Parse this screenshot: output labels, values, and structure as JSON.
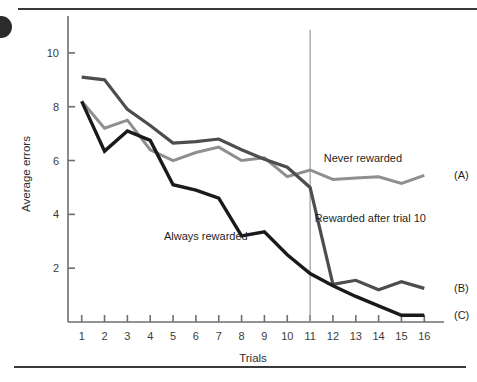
{
  "figure": {
    "background_color": "#ffffff",
    "top_rule_color": "#3a3a3a",
    "bottom_rule_color": "#3a3a3a"
  },
  "chart_data": {
    "type": "line",
    "title": "",
    "subtitle": "",
    "xlabel": "Trials",
    "ylabel": "Average errors",
    "grid": false,
    "legend_position": "inline-annotations",
    "xlim": [
      0.4,
      16.6
    ],
    "ylim": [
      0,
      11
    ],
    "x": [
      1,
      2,
      3,
      4,
      5,
      6,
      7,
      8,
      9,
      10,
      11,
      12,
      13,
      14,
      15,
      16
    ],
    "xticks": [
      "1",
      "2",
      "3",
      "4",
      "5",
      "6",
      "7",
      "8",
      "9",
      "10",
      "11",
      "12",
      "13",
      "14",
      "15",
      "16"
    ],
    "yticks": [
      "2",
      "4",
      "6",
      "8",
      "10"
    ],
    "ytick_values": [
      2,
      4,
      6,
      8,
      10
    ],
    "series": [
      {
        "name": "Never rewarded",
        "tag": "(A)",
        "color": "#8f8f8f",
        "width": 3.0,
        "values": [
          8.2,
          7.2,
          7.5,
          6.4,
          6.0,
          6.3,
          6.5,
          6.0,
          6.1,
          5.4,
          5.65,
          5.3,
          5.35,
          5.4,
          5.15,
          5.45
        ]
      },
      {
        "name": "Rewarded after trial 10",
        "tag": "(B)",
        "color": "#4d4d4d",
        "width": 3.2,
        "values": [
          9.1,
          9.0,
          7.9,
          7.3,
          6.65,
          6.7,
          6.8,
          6.4,
          6.05,
          5.75,
          5.0,
          1.4,
          1.55,
          1.2,
          1.5,
          1.25
        ]
      },
      {
        "name": "Always rewarded",
        "tag": "(C)",
        "color": "#1a1a1a",
        "width": 3.4,
        "values": [
          8.2,
          6.35,
          7.1,
          6.75,
          5.1,
          4.9,
          4.6,
          3.2,
          3.35,
          2.5,
          1.8,
          1.35,
          0.95,
          0.6,
          0.25,
          0.25
        ]
      }
    ],
    "annotations": [
      {
        "name": "never-rewarded",
        "text": "Never rewarded",
        "x": 11.6,
        "y": 5.95,
        "anchor": "start"
      },
      {
        "name": "rewarded-after-trial-10",
        "text": "Rewarded after trial 10",
        "x": 11.2,
        "y": 3.7,
        "anchor": "start"
      },
      {
        "name": "always-rewarded",
        "text": "Always rewarded",
        "x": 4.6,
        "y": 3.05,
        "anchor": "start"
      }
    ],
    "reference_line": {
      "name": "trial-11-divider",
      "x": 11,
      "color": "#9a9a9a",
      "label": ""
    }
  }
}
